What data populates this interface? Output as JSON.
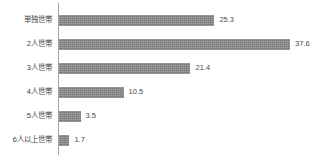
{
  "chart_data": {
    "type": "bar",
    "orientation": "horizontal",
    "title": "",
    "subtitle": "",
    "xlabel": "",
    "ylabel": "",
    "categories": [
      "単独世帯",
      "2人世帯",
      "3人世帯",
      "4人世帯",
      "5人世帯",
      "6人以上世帯"
    ],
    "values": [
      25.3,
      37.6,
      21.4,
      10.5,
      3.5,
      1.7
    ],
    "value_labels": [
      "25.3",
      "37.6",
      "21.4",
      "10.5",
      "3.5",
      "1.7"
    ],
    "xlim": [
      0,
      37.6
    ],
    "grid": false,
    "legend": false,
    "legend_position": "none",
    "bar_color": "#7c7c7c",
    "axis_color": "#a6a6a6",
    "label_color": "#3f3f3f",
    "value_color": "#4a4a4a",
    "background_color": "#ffffff"
  }
}
